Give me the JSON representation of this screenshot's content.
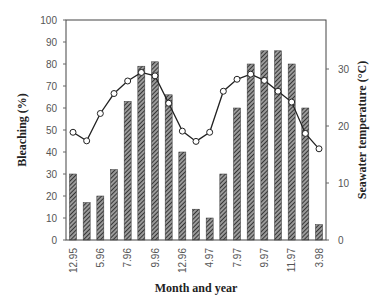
{
  "chart_data": {
    "type": "bar+line",
    "title": "",
    "xlabel": "Month and year",
    "ylabel": "Bleaching (%)",
    "y2label": "Seawater temperature (°C)",
    "ylim": [
      0,
      100
    ],
    "y2lim": [
      0,
      38.6
    ],
    "yticks": [
      0,
      10,
      20,
      30,
      40,
      50,
      60,
      70,
      80,
      90,
      100
    ],
    "y2ticks": [
      0,
      10,
      20,
      30
    ],
    "x_tick_labels": [
      {
        "index": 0,
        "label": "12.95"
      },
      {
        "index": 2,
        "label": "5.96"
      },
      {
        "index": 4,
        "label": "7.96"
      },
      {
        "index": 6,
        "label": "9.96"
      },
      {
        "index": 8,
        "label": "12.96"
      },
      {
        "index": 10,
        "label": "4.97"
      },
      {
        "index": 12,
        "label": "7.97"
      },
      {
        "index": 14,
        "label": "9.97"
      },
      {
        "index": 16,
        "label": "11.97"
      },
      {
        "index": 18,
        "label": "3.98"
      }
    ],
    "grid": false,
    "legend": null,
    "series": [
      {
        "name": "Bleaching (%)",
        "type": "bar",
        "axis": "left",
        "pattern": "diagonal-hatch",
        "values": [
          30,
          17,
          20,
          32,
          63,
          79,
          81,
          66,
          40,
          14,
          10,
          30,
          60,
          80,
          86,
          86,
          80,
          60,
          7
        ]
      },
      {
        "name": "Seawater temperature (°C)",
        "type": "line",
        "axis": "right",
        "marker": "open-circle",
        "values": [
          18.9,
          17.4,
          22.2,
          25.7,
          27.9,
          29.4,
          28.8,
          24.0,
          19.1,
          17.3,
          18.9,
          26.1,
          28.2,
          29.1,
          28.0,
          26.1,
          24.2,
          18.7,
          16.0
        ]
      }
    ]
  }
}
